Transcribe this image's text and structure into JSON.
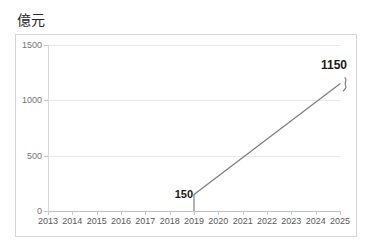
{
  "chart_data": {
    "type": "line",
    "title": "",
    "unit_label": "億元",
    "xlabel": "",
    "ylabel": "億元",
    "x": [
      2013,
      2014,
      2015,
      2016,
      2017,
      2018,
      2019,
      2020,
      2021,
      2022,
      2023,
      2024,
      2025
    ],
    "categories": [
      "2013",
      "2014",
      "2015",
      "2016",
      "2017",
      "2018",
      "2019",
      "2020",
      "2021",
      "2022",
      "2023",
      "2024",
      "2025"
    ],
    "series": [
      {
        "name": "市場規模",
        "x": [
          2019,
          2025
        ],
        "values": [
          150,
          1150
        ]
      }
    ],
    "point_labels": [
      {
        "x": 2019,
        "value": 150,
        "text": "150",
        "position": "left"
      },
      {
        "x": 2025,
        "value": 1150,
        "text": "1150",
        "position": "above-right"
      }
    ],
    "annotations": [
      {
        "type": "break-squiggle",
        "near_x": 2025,
        "near_value": 1150
      }
    ],
    "ylim": [
      0,
      1500
    ],
    "yticks": [
      0,
      500,
      1000,
      1500
    ],
    "ytick_labels": [
      "0",
      "500",
      "1000",
      "1500"
    ],
    "xlim": [
      2013,
      2025
    ],
    "grid": true,
    "grid_axis": "y",
    "legend": false,
    "legend_position": "none",
    "line_color": "#7f7f7f",
    "grid_color": "#e8e8e8",
    "text_color": "#595959",
    "label_color": "#1a1a1a",
    "frame_color": "#d5d5d5",
    "background": "#ffffff"
  },
  "axes": {
    "y": {
      "ticks": [
        {
          "label": "1500",
          "value": 1500
        },
        {
          "label": "1000",
          "value": 1000
        },
        {
          "label": "500",
          "value": 500
        },
        {
          "label": "0",
          "value": 0
        }
      ]
    },
    "x": {
      "ticks": [
        {
          "label": "2013"
        },
        {
          "label": "2014"
        },
        {
          "label": "2015"
        },
        {
          "label": "2016"
        },
        {
          "label": "2017"
        },
        {
          "label": "2018"
        },
        {
          "label": "2019"
        },
        {
          "label": "2020"
        },
        {
          "label": "2021"
        },
        {
          "label": "2022"
        },
        {
          "label": "2023"
        },
        {
          "label": "2024"
        },
        {
          "label": "2025"
        }
      ]
    }
  },
  "labels": {
    "unit": "億元",
    "start_value": "150",
    "end_value": "1150"
  }
}
